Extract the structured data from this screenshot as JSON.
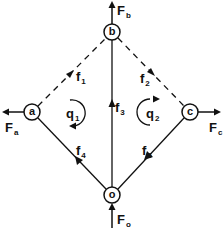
{
  "diagram": {
    "type": "flow-network",
    "nodes": [
      {
        "id": "a",
        "label": "a",
        "x": 32,
        "y": 112
      },
      {
        "id": "b",
        "label": "b",
        "x": 112,
        "y": 32
      },
      {
        "id": "c",
        "label": "c",
        "x": 190,
        "y": 112
      },
      {
        "id": "o",
        "label": "o",
        "x": 112,
        "y": 195
      }
    ],
    "edges": [
      {
        "id": "f1",
        "label": "f",
        "sub": "1",
        "from": "a",
        "to": "b",
        "style": "dashed",
        "arrow_direction": "toward b"
      },
      {
        "id": "f2",
        "label": "f",
        "sub": "2",
        "from": "c",
        "to": "b",
        "style": "dashed",
        "arrow_direction": "toward b"
      },
      {
        "id": "f3",
        "label": "f",
        "sub": "3",
        "from": "o",
        "to": "b",
        "style": "solid",
        "arrow_direction": "toward b"
      },
      {
        "id": "f4",
        "label": "f",
        "sub": "4",
        "from": "o",
        "to": "a",
        "style": "solid",
        "arrow_direction": "toward a"
      },
      {
        "id": "f5",
        "label": "f",
        "sub": "5",
        "from": "c",
        "to": "o",
        "style": "solid",
        "arrow_direction": "toward o"
      }
    ],
    "external_flows": [
      {
        "id": "Fa",
        "label": "F",
        "sub": "a",
        "node": "a",
        "direction": "out-left"
      },
      {
        "id": "Fb",
        "label": "F",
        "sub": "b",
        "node": "b",
        "direction": "out-up"
      },
      {
        "id": "Fc",
        "label": "F",
        "sub": "c",
        "node": "c",
        "direction": "out-right"
      },
      {
        "id": "Fo",
        "label": "F",
        "sub": "o",
        "node": "o",
        "direction": "in-up"
      }
    ],
    "loops": [
      {
        "id": "q1",
        "label": "q",
        "sub": "1",
        "direction": "clockwise"
      },
      {
        "id": "q2",
        "label": "q",
        "sub": "2",
        "direction": "clockwise"
      }
    ],
    "colors": {
      "stroke": "#111111",
      "background": "#ffffff"
    }
  }
}
